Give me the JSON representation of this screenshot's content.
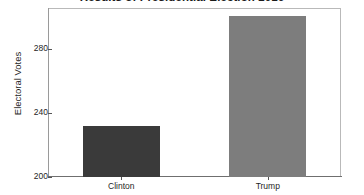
{
  "chart_data": {
    "type": "bar",
    "title": "Results of Presidential Election 2016",
    "xlabel": "",
    "ylabel": "Electoral Votes",
    "categories": [
      "Clinton",
      "Trump"
    ],
    "values": [
      232,
      301
    ],
    "ylim": [
      200,
      306
    ],
    "yticks": [
      200,
      240,
      280
    ],
    "ytick_labels": [
      "200",
      "240",
      "280"
    ],
    "grid": false,
    "legend": false,
    "series": [
      {
        "name": "Electoral Votes",
        "values": [
          232,
          301
        ],
        "colors": [
          "#3a3a3a",
          "#7d7d7d"
        ]
      }
    ],
    "bar_colors": {
      "clinton": "#3a3a3a",
      "trump": "#7d7d7d"
    },
    "frame_color": "#b9b9b9",
    "axis_color": "#6f6f6f",
    "background": "#ffffff"
  }
}
